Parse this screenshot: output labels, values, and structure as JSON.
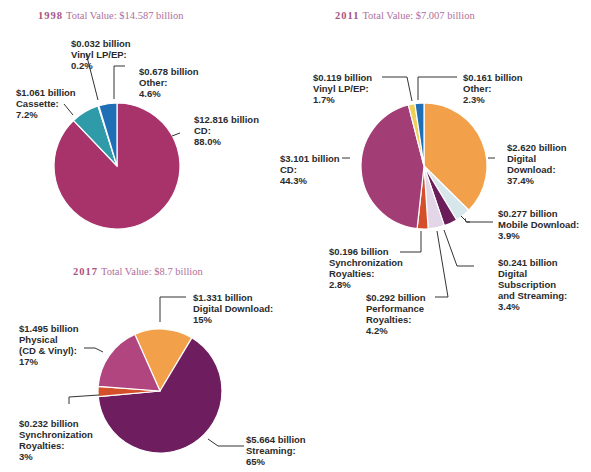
{
  "charts": {
    "c1998": {
      "year": "1998",
      "total": "Total Value: $14.587 billion"
    },
    "c2011": {
      "year": "2011",
      "total": "Total Value: $7.007 billion"
    },
    "c2017": {
      "year": "2017",
      "total": "Total Value: $8.7 billion"
    }
  },
  "labels": {
    "l1998_vinyl": [
      "$0.032 billion",
      "Vinyl LP/EP:",
      "0.2%"
    ],
    "l1998_other": [
      "$0.678 billion",
      "Other:",
      "4.6%"
    ],
    "l1998_cassette": [
      "$1.061 billion",
      "Cassette:",
      "7.2%"
    ],
    "l1998_cd": [
      "$12.816 billion",
      "CD:",
      "88.0%"
    ],
    "l2011_vinyl": [
      "$0.119 billion",
      "Vinyl LP/EP:",
      "1.7%"
    ],
    "l2011_other": [
      "$0.161 billion",
      "Other:",
      "2.3%"
    ],
    "l2011_cd": [
      "$3.101 billion",
      "CD:",
      "44.3%"
    ],
    "l2011_digital": [
      "$2.620 billion",
      "Digital",
      "Download:",
      "37.4%"
    ],
    "l2011_mobile": [
      "$0.277 billion",
      "Mobile Download:",
      "3.9%"
    ],
    "l2011_sync": [
      "$0.196 billion",
      "Synchronization",
      "Royalties:",
      "2.8%"
    ],
    "l2011_subscription": [
      "$0.241 billion",
      "Digital",
      "Subscription",
      "and Streaming:",
      "3.4%"
    ],
    "l2011_performance": [
      "$0.292 billion",
      "Performance",
      "Royalties:",
      "4.2%"
    ],
    "l2017_digital": [
      "$1.331 billion",
      "Digital Download:",
      "15%"
    ],
    "l2017_physical": [
      "$1.495 billion",
      "Physical",
      "(CD & Vinyl):",
      "17%"
    ],
    "l2017_sync": [
      "$0.232 billion",
      "Synchronization",
      "Royalties:",
      "3%"
    ],
    "l2017_streaming": [
      "$5.664 billion",
      "Streaming:",
      "65%"
    ]
  },
  "colors": {
    "title": "#b0709a",
    "cd": "#a8326a",
    "cassette": "#2f9aa8",
    "other": "#1f6fb6",
    "vinyl_1998": "#dbe8ee",
    "digital_download": "#f2a04a",
    "mobile_download": "#d7e6ea",
    "subscription": "#6b1d5a",
    "performance": "#e3d6e8",
    "sync": "#d4502a",
    "cd_2011": "#a33d76",
    "vinyl_2011": "#f0cf59",
    "streaming": "#6e1d5e",
    "physical": "#b04580"
  },
  "chart_data": [
    {
      "type": "pie",
      "title": "1998 Total Value: $14.587 billion",
      "categories": [
        "CD",
        "Cassette",
        "Vinyl LP/EP",
        "Other"
      ],
      "values": [
        12.816,
        1.061,
        0.032,
        0.678
      ],
      "percentages": [
        88.0,
        7.2,
        0.2,
        4.6
      ],
      "unit": "billion USD"
    },
    {
      "type": "pie",
      "title": "2011 Total Value: $7.007 billion",
      "categories": [
        "Digital Download",
        "Mobile Download",
        "Digital Subscription and Streaming",
        "Performance Royalties",
        "Synchronization Royalties",
        "CD",
        "Vinyl LP/EP",
        "Other"
      ],
      "values": [
        2.62,
        0.277,
        0.241,
        0.292,
        0.196,
        3.101,
        0.119,
        0.161
      ],
      "percentages": [
        37.4,
        3.9,
        3.4,
        4.2,
        2.8,
        44.3,
        1.7,
        2.3
      ],
      "unit": "billion USD"
    },
    {
      "type": "pie",
      "title": "2017 Total Value: $8.7 billion",
      "categories": [
        "Digital Download",
        "Streaming",
        "Synchronization Royalties",
        "Physical (CD & Vinyl)"
      ],
      "values": [
        1.331,
        5.664,
        0.232,
        1.495
      ],
      "percentages": [
        15,
        65,
        3,
        17
      ],
      "unit": "billion USD"
    }
  ]
}
